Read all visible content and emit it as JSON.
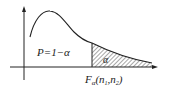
{
  "diagram": {
    "type": "F-distribution density with upper-tail critical region",
    "labels": {
      "left_region": "P=1−α",
      "tail_region": "α",
      "critical_F": "F",
      "critical_sub": "α",
      "critical_args_open": "(n",
      "n1_sub": "1",
      "comma_n": ",n",
      "n2_sub": "2",
      "close": ")"
    },
    "colors": {
      "ink": "#222222",
      "background": "#ffffff"
    }
  }
}
